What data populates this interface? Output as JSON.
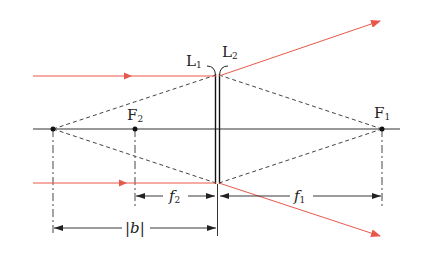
{
  "diagram": {
    "type": "optics-lens-system",
    "colors": {
      "ray": "#e8584a",
      "line": "#333333",
      "dashed": "#444444",
      "background": "#ffffff"
    },
    "labels": {
      "lens1": "L",
      "lens1_sub": "1",
      "lens2": "L",
      "lens2_sub": "2",
      "focus1": "F",
      "focus1_sub": "1",
      "focus2": "F",
      "focus2_sub": "2",
      "dim_f2": "f",
      "dim_f2_sub": "2",
      "dim_f1": "f",
      "dim_f1_sub": "1",
      "dim_b": "|b|"
    },
    "points": {
      "virtual_focus_x": 53,
      "F2_x": 135,
      "F1_x": 382,
      "lens_x": 217,
      "axis_y": 129
    }
  }
}
